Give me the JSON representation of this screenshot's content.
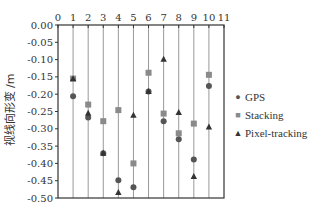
{
  "chart_data": {
    "type": "scatter",
    "title": "",
    "xlabel": "",
    "ylabel": "视线向形变 /m",
    "xlim": [
      0,
      11
    ],
    "ylim": [
      -0.5,
      0
    ],
    "x_ticks": [
      "0",
      "1",
      "2",
      "3",
      "4",
      "5",
      "6",
      "7",
      "8",
      "9",
      "10",
      "11"
    ],
    "y_ticks": [
      "0.00",
      "-0.05",
      "-0.10",
      "-0.15",
      "-0.20",
      "-0.25",
      "-0.30",
      "-0.35",
      "-0.40",
      "-0.45",
      "-0.50"
    ],
    "x_axis_position": "top",
    "vertical_lines_at": [
      1,
      2,
      3,
      4,
      5,
      6,
      7,
      8,
      9,
      10
    ],
    "legend_position": "right",
    "x": [
      1,
      2,
      3,
      4,
      5,
      6,
      7,
      8,
      9,
      10
    ],
    "series": [
      {
        "name": "GPS",
        "marker": "circle",
        "values": [
          -0.206,
          -0.267,
          -0.371,
          -0.449,
          -0.469,
          -0.192,
          -0.278,
          -0.33,
          -0.389,
          -0.176
        ]
      },
      {
        "name": "Stacking",
        "marker": "square",
        "values": [
          -0.155,
          -0.23,
          -0.278,
          -0.246,
          -0.4,
          -0.138,
          -0.256,
          -0.313,
          -0.285,
          -0.144
        ]
      },
      {
        "name": "Pixel-tracking",
        "marker": "triangle",
        "values": [
          -0.155,
          -0.255,
          -0.371,
          -0.484,
          -0.261,
          -0.192,
          -0.099,
          -0.253,
          -0.438,
          -0.295
        ]
      }
    ],
    "colors": {
      "GPS": "#555555",
      "Stacking": "#8a8a8a",
      "Pixel-tracking": "#333333",
      "grid": "#999999",
      "axis": "#333333"
    }
  },
  "legend": {
    "items": [
      {
        "label": "GPS",
        "symbol": "●"
      },
      {
        "label": "Stacking",
        "symbol": "■"
      },
      {
        "label": "Pixel-tracking",
        "symbol": "▲"
      }
    ]
  }
}
